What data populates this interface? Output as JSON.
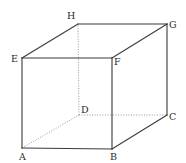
{
  "diagram": {
    "type": "cube-perspective",
    "colors": {
      "solid_edge": "#3a3a3a",
      "hidden_edge": "#8a8a8a",
      "label": "#2a2a2a",
      "background": "#ffffff"
    },
    "vertices": {
      "A": {
        "label": "A",
        "x": 22,
        "y": 148
      },
      "B": {
        "label": "B",
        "x": 112,
        "y": 149
      },
      "C": {
        "label": "C",
        "x": 167,
        "y": 115
      },
      "D": {
        "label": "D",
        "x": 79,
        "y": 115
      },
      "E": {
        "label": "E",
        "x": 22,
        "y": 58
      },
      "F": {
        "label": "F",
        "x": 112,
        "y": 58
      },
      "G": {
        "label": "G",
        "x": 167,
        "y": 24
      },
      "H": {
        "label": "H",
        "x": 78,
        "y": 24
      }
    },
    "edges": {
      "solid": [
        [
          "A",
          "B"
        ],
        [
          "B",
          "C"
        ],
        [
          "C",
          "G"
        ],
        [
          "G",
          "H"
        ],
        [
          "H",
          "E"
        ],
        [
          "E",
          "A"
        ],
        [
          "E",
          "F"
        ],
        [
          "F",
          "B"
        ],
        [
          "F",
          "G"
        ]
      ],
      "hidden": [
        [
          "A",
          "D"
        ],
        [
          "D",
          "C"
        ],
        [
          "D",
          "H"
        ]
      ]
    },
    "labels": [
      {
        "id": "A",
        "text": "A",
        "x": 19,
        "y": 160
      },
      {
        "id": "B",
        "text": "B",
        "x": 110,
        "y": 160
      },
      {
        "id": "C",
        "text": "C",
        "x": 169,
        "y": 120
      },
      {
        "id": "D",
        "text": "D",
        "x": 81,
        "y": 113
      },
      {
        "id": "E",
        "text": "E",
        "x": 11,
        "y": 62
      },
      {
        "id": "F",
        "text": "F",
        "x": 114,
        "y": 65
      },
      {
        "id": "G",
        "text": "G",
        "x": 169,
        "y": 28
      },
      {
        "id": "H",
        "text": "H",
        "x": 67,
        "y": 19
      }
    ]
  }
}
